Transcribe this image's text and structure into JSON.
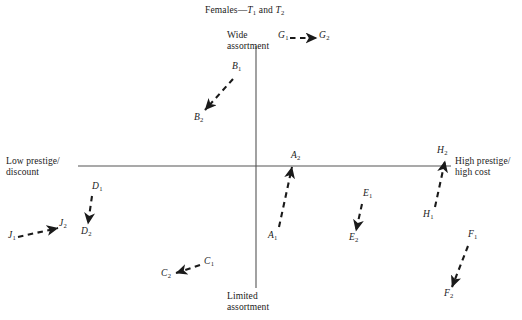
{
  "chart_data": {
    "type": "scatter",
    "title_parts": {
      "prefix": "Females—",
      "var1": "T",
      "sub1": "1",
      "conj": " and ",
      "var2": "T",
      "sub2": "2"
    },
    "xlabel": "",
    "ylabel": "",
    "grid": false,
    "legend": "none",
    "axes": {
      "vertical": {
        "x": 256,
        "y_top": 46,
        "y_bottom": 288,
        "top_label": "Wide\nassortment",
        "bottom_label": "Limited\nassortment"
      },
      "horizontal": {
        "y": 166,
        "x_left": 78,
        "x_right": 451,
        "left_label": "Low prestige/\ndiscount",
        "right_label": "High prestige/\nhigh cost"
      }
    },
    "axis_labels": {
      "top": {
        "line1": "Wide",
        "line2": "assortment"
      },
      "bottom": {
        "line1": "Limited",
        "line2": "assortment"
      },
      "left": {
        "line1": "Low prestige/",
        "line2": "discount"
      },
      "right": {
        "line1": "High prestige/",
        "line2": "high cost"
      }
    },
    "series_style": {
      "line": "dashed",
      "arrow": "filled-triangle",
      "color": "#1a1a1a"
    },
    "vectors": [
      {
        "name": "A",
        "from_label": "A",
        "from_sub": "1",
        "to_label": "A",
        "to_sub": "2",
        "x1": 279,
        "y1": 227,
        "x2": 292,
        "y2": 167,
        "label1_x": 268,
        "label1_y": 230,
        "label2_x": 291,
        "label2_y": 150
      },
      {
        "name": "B",
        "from_label": "B",
        "from_sub": "1",
        "to_label": "B",
        "to_sub": "2",
        "x1": 233,
        "y1": 79,
        "x2": 205,
        "y2": 110,
        "label1_x": 232,
        "label1_y": 61,
        "label2_x": 194,
        "label2_y": 112
      },
      {
        "name": "C",
        "from_label": "C",
        "from_sub": "1",
        "to_label": "C",
        "to_sub": "2",
        "x1": 200,
        "y1": 265,
        "x2": 176,
        "y2": 273,
        "label1_x": 204,
        "label1_y": 256,
        "label2_x": 161,
        "label2_y": 268
      },
      {
        "name": "D",
        "from_label": "D",
        "from_sub": "1",
        "to_label": "D",
        "to_sub": "2",
        "x1": 92,
        "y1": 196,
        "x2": 88,
        "y2": 224,
        "label1_x": 92,
        "label1_y": 181,
        "label2_x": 81,
        "label2_y": 226
      },
      {
        "name": "E",
        "from_label": "E",
        "from_sub": "1",
        "to_label": "E",
        "to_sub": "2",
        "x1": 362,
        "y1": 204,
        "x2": 356,
        "y2": 231,
        "label1_x": 363,
        "label1_y": 188,
        "label2_x": 349,
        "label2_y": 232
      },
      {
        "name": "F",
        "from_label": "F",
        "from_sub": "1",
        "to_label": "F",
        "to_sub": "2",
        "x1": 468,
        "y1": 246,
        "x2": 452,
        "y2": 287,
        "label1_x": 468,
        "label1_y": 229,
        "label2_x": 444,
        "label2_y": 288
      },
      {
        "name": "G",
        "from_label": "G",
        "from_sub": "1",
        "to_label": "G",
        "to_sub": "2",
        "x1": 290,
        "y1": 38,
        "x2": 317,
        "y2": 38,
        "label1_x": 278,
        "label1_y": 30,
        "label2_x": 319,
        "label2_y": 30
      },
      {
        "name": "H",
        "from_label": "H",
        "from_sub": "1",
        "to_label": "H",
        "to_sub": "2",
        "x1": 435,
        "y1": 207,
        "x2": 445,
        "y2": 161,
        "label1_x": 423,
        "label1_y": 209,
        "label2_x": 437,
        "label2_y": 145
      },
      {
        "name": "J",
        "from_label": "J",
        "from_sub": "1",
        "to_label": "J",
        "to_sub": "2",
        "x1": 18,
        "y1": 237,
        "x2": 58,
        "y2": 228,
        "label1_x": 8,
        "label1_y": 230,
        "label2_x": 59,
        "label2_y": 218
      }
    ]
  },
  "colors": {
    "axis": "#555555",
    "ink": "#1a1a1a",
    "background": "#ffffff"
  }
}
